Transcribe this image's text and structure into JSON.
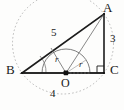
{
  "figure": {
    "vertices": [
      {
        "id": "A",
        "label": "A",
        "x": 104,
        "y": 14,
        "label_x": 103,
        "label_y": 2
      },
      {
        "id": "B",
        "label": "B",
        "x": 22,
        "y": 73,
        "label_x": 7,
        "label_y": 63
      },
      {
        "id": "C",
        "label": "C",
        "x": 104,
        "y": 73,
        "label_x": 110,
        "label_y": 63
      },
      {
        "id": "O",
        "label": "O",
        "x": 66,
        "y": 73,
        "label_x": 62,
        "label_y": 76
      }
    ],
    "side_labels": [
      {
        "id": "AB",
        "label": "5",
        "x": 52,
        "y": 30
      },
      {
        "id": "AC",
        "label": "3",
        "x": 110,
        "y": 36
      },
      {
        "id": "BC",
        "label": "4",
        "x": 50,
        "y": 88
      }
    ],
    "radius_labels": [
      {
        "id": "r-to-AB",
        "label": "r",
        "x": 56,
        "y": 57
      },
      {
        "id": "r-to-C",
        "label": "r",
        "x": 80,
        "y": 62
      }
    ],
    "markers": {
      "right_angle_at": "C",
      "angle_arc_at": "B"
    },
    "colors": {
      "triangle_stroke": "#1c1c1c",
      "incircle_stroke": "#6f6f6f",
      "circumcircle_stroke": "#9b9b9b",
      "helper_stroke": "#7a7a7a",
      "label_color": "#1a1a1a"
    }
  }
}
